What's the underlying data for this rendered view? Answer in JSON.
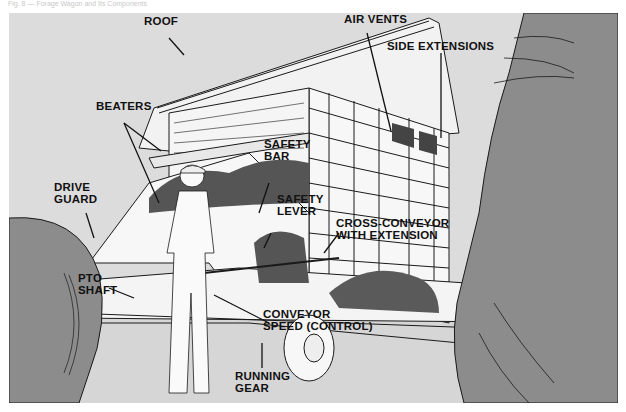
{
  "figure": {
    "caption": "Fig. 8 — Forage Wagon and Its Components",
    "colors": {
      "background": "#dcdcdc",
      "tire": "#8c8c8c",
      "line": "#1a1a1a",
      "wagon": "#f7f7f7",
      "forage": "#555555"
    }
  },
  "labels": {
    "roof": "ROOF",
    "air_vents": "AIR VENTS",
    "side_extensions": "SIDE EXTENSIONS",
    "beaters": "BEATERS",
    "safety_bar_1": "SAFETY",
    "safety_bar_2": "BAR",
    "drive_guard_1": "DRIVE",
    "drive_guard_2": "GUARD",
    "safety_lever_1": "SAFETY",
    "safety_lever_2": "LEVER",
    "cross_conveyor_1": "CROSS-CONVEYOR",
    "cross_conveyor_2": "WITH EXTENSION",
    "pto_shaft_1": "PTO",
    "pto_shaft_2": "SHAFT",
    "conveyor_speed_1": "CONVEYOR",
    "conveyor_speed_2": "SPEED (CONTROL)",
    "running_gear_1": "RUNNING",
    "running_gear_2": "GEAR"
  },
  "wagon_brand": "JOHN"
}
